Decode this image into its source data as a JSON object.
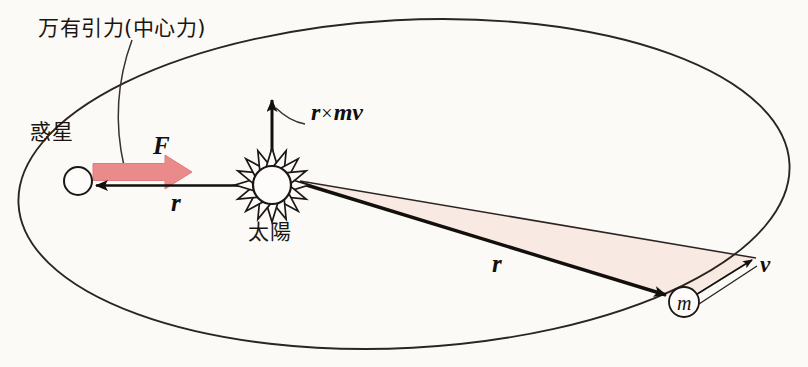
{
  "figure": {
    "title_text": "万有引力(中心力)",
    "background_color": "#fbfaf7",
    "ink_color": "#16120f",
    "force_arrow_color": "#ea8a8a",
    "swept_area_color": "#f8e9e2",
    "width": 808,
    "height": 367
  },
  "labels": {
    "gravity_note": "万有引力(中心力)",
    "planet": "惑星",
    "sun": "太陽",
    "force_vector": "F",
    "radius_vector_left": "r",
    "radius_vector_right": "r",
    "velocity_vector": "v",
    "mass_marker": "m",
    "angular_momentum_r": "r",
    "angular_momentum_times": "×",
    "angular_momentum_mv": "mv"
  },
  "bodies": {
    "planet": {
      "name": "惑星",
      "cx": 78,
      "cy": 181,
      "r": 14
    },
    "sun": {
      "name": "太陽",
      "cx": 272,
      "cy": 185,
      "core_r": 19,
      "ray_r": 37,
      "rays": 16
    },
    "mass": {
      "name": "m",
      "cx": 684,
      "cy": 302,
      "r": 15
    }
  },
  "vectors": {
    "F": {
      "label": "F",
      "from": [
        95,
        172
      ],
      "to": [
        190,
        172
      ],
      "color": "#ea8a8a",
      "meaning": "gravitational central force on planet"
    },
    "r_left": {
      "label": "r",
      "from": [
        253,
        185
      ],
      "to": [
        90,
        185
      ],
      "color": "#1a1510",
      "meaning": "radius vector sun to planet"
    },
    "r_right": {
      "label": "r",
      "from": [
        300,
        183
      ],
      "to": [
        672,
        297
      ],
      "color": "#1a1510",
      "meaning": "radius vector sun to orbiting mass"
    },
    "v": {
      "label": "v",
      "from": [
        690,
        294
      ],
      "to": [
        754,
        257
      ],
      "color": "#1a1510",
      "meaning": "velocity of orbiting mass"
    },
    "L": {
      "label": "r × mv",
      "from": [
        272,
        168
      ],
      "to": [
        272,
        95
      ],
      "color": "#1a1510",
      "meaning": "angular momentum, out of orbital plane"
    }
  },
  "orbit": {
    "type": "ellipse",
    "cx": 404,
    "cy": 184,
    "rx": 386,
    "ry": 164,
    "rotation_deg": -3,
    "stroke": "#2b2420"
  },
  "swept_area": {
    "fill": "#f8e9e2",
    "description": "area swept by radius vector between sun, mass m and orbit point"
  }
}
